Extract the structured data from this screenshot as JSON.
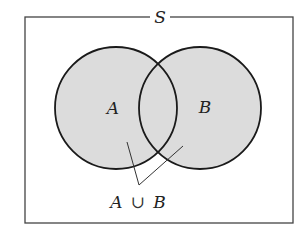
{
  "diagram": {
    "type": "venn",
    "universe_label": "S",
    "sets": [
      {
        "label": "A",
        "cx": 116,
        "cy": 108,
        "r": 61
      },
      {
        "label": "B",
        "cx": 200,
        "cy": 108,
        "r": 61
      }
    ],
    "shaded_region": "A ∪ B",
    "annotation": {
      "set_a": "A",
      "operator": "∪",
      "set_b": "B"
    },
    "colors": {
      "fill": "#dcdcdc",
      "stroke": "#1a1a1a",
      "frame": "#444444"
    }
  }
}
